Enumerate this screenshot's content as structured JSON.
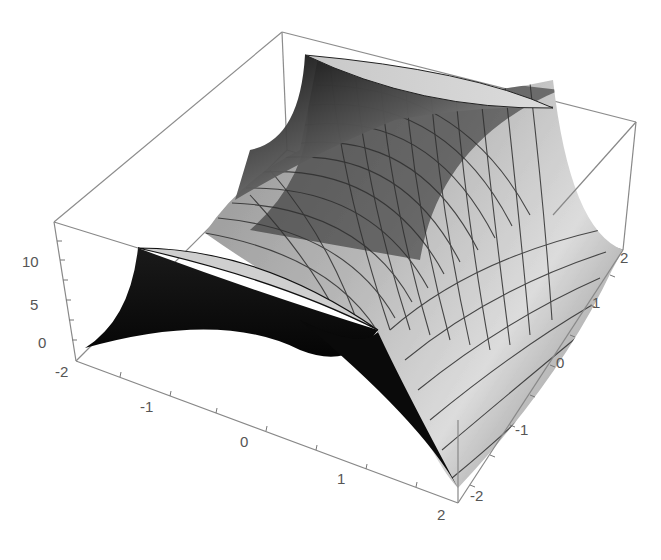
{
  "chart_data": {
    "type": "surface3d",
    "title": "",
    "xlabel": "",
    "ylabel": "",
    "zlabel": "",
    "x_range": [
      -2,
      2
    ],
    "y_range": [
      -2,
      2
    ],
    "z_range": [
      0,
      12
    ],
    "x_ticks": [
      "-2",
      "-1",
      "0",
      "1",
      "2"
    ],
    "y_ticks": [
      "-2",
      "-1",
      "0",
      "1",
      "2"
    ],
    "z_ticks": [
      "0",
      "5",
      "10"
    ],
    "mesh": true,
    "mesh_lines": 15,
    "box": true,
    "colors": {
      "box": "#888888",
      "surface_light": "#e8e8e8",
      "surface_dark": "#111111",
      "mesh": "#333333",
      "ticks": "#555555"
    }
  },
  "axes": {
    "z_labels": [
      {
        "text": "10",
        "x": 22,
        "y": 262
      },
      {
        "text": "5",
        "x": 30,
        "y": 305
      },
      {
        "text": "0",
        "x": 38,
        "y": 343
      }
    ],
    "x_labels": [
      {
        "text": "-2",
        "x": 55,
        "y": 372
      },
      {
        "text": "-1",
        "x": 140,
        "y": 407
      },
      {
        "text": "0",
        "x": 240,
        "y": 442
      },
      {
        "text": "1",
        "x": 337,
        "y": 479
      },
      {
        "text": "2",
        "x": 437,
        "y": 515
      }
    ],
    "y_labels": [
      {
        "text": "-2",
        "x": 470,
        "y": 496
      },
      {
        "text": "-1",
        "x": 515,
        "y": 430
      },
      {
        "text": "0",
        "x": 556,
        "y": 363
      },
      {
        "text": "1",
        "x": 592,
        "y": 303
      },
      {
        "text": "2",
        "x": 620,
        "y": 258
      }
    ]
  }
}
